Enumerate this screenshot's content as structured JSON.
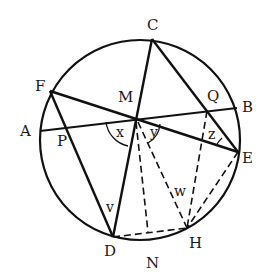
{
  "diagram": {
    "type": "circle-geometry",
    "circle": {
      "cx": 140,
      "cy": 140,
      "r": 100
    },
    "points": {
      "A": {
        "x": 40,
        "y": 131,
        "label": "A"
      },
      "B": {
        "x": 237,
        "y": 108,
        "label": "B"
      },
      "C": {
        "x": 152,
        "y": 39,
        "label": "C"
      },
      "D": {
        "x": 113,
        "y": 237,
        "label": "D"
      },
      "E": {
        "x": 238,
        "y": 152,
        "label": "E"
      },
      "F": {
        "x": 50,
        "y": 91,
        "label": "F"
      },
      "H": {
        "x": 187,
        "y": 228,
        "label": "H"
      },
      "M": {
        "x": 134,
        "y": 118,
        "label": "M"
      },
      "N": {
        "x": 148,
        "y": 234,
        "label": "N"
      },
      "P": {
        "x": 66,
        "y": 127,
        "label": "P"
      },
      "Q": {
        "x": 207,
        "y": 111,
        "label": "Q"
      }
    },
    "angle_labels": {
      "x": "x",
      "y": "y",
      "z": "z",
      "v": "v",
      "w": "w"
    },
    "solid_segments": [
      "A-B",
      "F-E",
      "C-D",
      "C-E",
      "F-D"
    ],
    "dashed_segments": [
      "M-N",
      "M-H",
      "Q-H",
      "E-H",
      "D-H"
    ]
  }
}
